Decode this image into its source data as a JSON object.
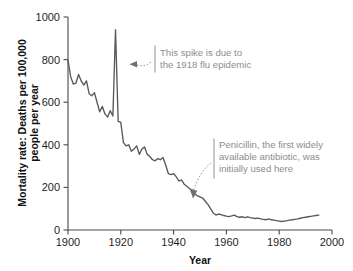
{
  "chart_data": {
    "type": "line",
    "title": "",
    "xlabel": "Year",
    "ylabel": "Mortality rate: Deaths per 100,000 people per year",
    "xlim": [
      1900,
      2000
    ],
    "ylim": [
      0,
      1000
    ],
    "xticks": [
      "1900",
      "1920",
      "1940",
      "1960",
      "1980",
      "2000"
    ],
    "yticks": [
      "0",
      "200",
      "400",
      "600",
      "800",
      "1000"
    ],
    "grid": false,
    "legend": "none",
    "series": [
      {
        "name": "Infectious disease mortality rate",
        "x": [
          1900,
          1901,
          1902,
          1903,
          1904,
          1905,
          1906,
          1907,
          1908,
          1909,
          1910,
          1911,
          1912,
          1913,
          1914,
          1915,
          1916,
          1917,
          1918,
          1919,
          1920,
          1921,
          1922,
          1923,
          1924,
          1925,
          1926,
          1927,
          1928,
          1929,
          1930,
          1931,
          1932,
          1933,
          1934,
          1935,
          1936,
          1937,
          1938,
          1939,
          1940,
          1941,
          1942,
          1943,
          1944,
          1945,
          1946,
          1947,
          1948,
          1949,
          1950,
          1951,
          1952,
          1953,
          1954,
          1955,
          1956,
          1957,
          1958,
          1959,
          1960,
          1961,
          1962,
          1963,
          1964,
          1965,
          1966,
          1967,
          1968,
          1969,
          1970,
          1971,
          1972,
          1973,
          1974,
          1975,
          1976,
          1977,
          1978,
          1979,
          1980,
          1981,
          1982,
          1983,
          1984,
          1985,
          1986,
          1987,
          1988,
          1989,
          1990,
          1991,
          1992,
          1993,
          1994,
          1995
        ],
        "values": [
          797,
          720,
          685,
          690,
          730,
          700,
          680,
          700,
          640,
          630,
          645,
          600,
          555,
          580,
          545,
          530,
          560,
          535,
          940,
          510,
          505,
          410,
          395,
          400,
          370,
          380,
          395,
          355,
          380,
          390,
          355,
          345,
          330,
          325,
          335,
          330,
          340,
          305,
          265,
          260,
          265,
          250,
          230,
          235,
          215,
          205,
          195,
          185,
          170,
          160,
          155,
          150,
          135,
          120,
          100,
          80,
          70,
          75,
          72,
          68,
          65,
          63,
          66,
          70,
          63,
          60,
          62,
          58,
          62,
          58,
          56,
          54,
          56,
          52,
          50,
          48,
          52,
          48,
          46,
          44,
          42,
          40,
          42,
          44,
          46,
          48,
          50,
          52,
          55,
          58,
          60,
          62,
          64,
          66,
          68,
          70
        ]
      }
    ],
    "annotations": [
      {
        "name": "flu-epidemic-annotation",
        "lines": [
          "This spike is due to",
          "the 1918 flu epidemic"
        ],
        "points_to_year": 1918,
        "points_to_value": 780
      },
      {
        "name": "penicillin-annotation",
        "lines": [
          "Penicillin, the first widely",
          "available antibiotic, was",
          "initially used here"
        ],
        "points_to_year": 1950,
        "points_to_value": 120
      }
    ],
    "colors": {
      "line": "#585858",
      "axis": "#4a4a4a",
      "annotation_text": "#8d8d8d",
      "annotation_rule": "#a9a9a9",
      "background": "#ffffff"
    }
  }
}
